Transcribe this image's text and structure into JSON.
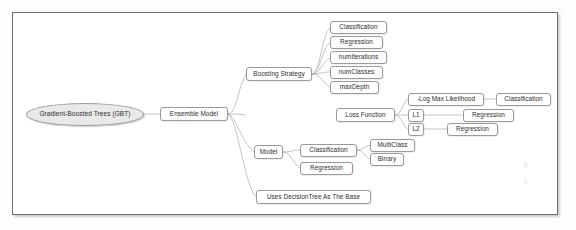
{
  "diagram": {
    "type": "mind-map",
    "root": "Gradient-Boosted Trees (GBT)",
    "nodes": {
      "root": "Gradient-Boosted Trees (GBT)",
      "ensemble_model": "Ensemble Model",
      "boosting_strategy": "Boosting Strategy",
      "bs_classification": "Classification",
      "bs_regression": "Regression",
      "bs_numiterations": "numIterations",
      "bs_numclasses": "numClasses",
      "bs_maxdepth": "maxDepth",
      "loss_function": "Loss Function",
      "lf_logmax": "-Log Max Likelihood",
      "lf_logmax_target": "Classification",
      "lf_l1": "L1",
      "lf_l1_target": "Regression",
      "lf_l2": "L2",
      "lf_l2_target": "Regression",
      "model": "Model",
      "model_classification": "Classification",
      "model_multiclass": "MultiClass",
      "model_binary": "Binary",
      "model_regression": "Regression",
      "uses_decisiontree": "Uses DecisionTree As The Base"
    },
    "edges": [
      {
        "from": "root",
        "to": "ensemble_model"
      },
      {
        "from": "ensemble_model",
        "to": "boosting_strategy"
      },
      {
        "from": "ensemble_model",
        "to": "loss_function"
      },
      {
        "from": "ensemble_model",
        "to": "model"
      },
      {
        "from": "ensemble_model",
        "to": "uses_decisiontree"
      },
      {
        "from": "boosting_strategy",
        "to": "bs_classification"
      },
      {
        "from": "boosting_strategy",
        "to": "bs_regression"
      },
      {
        "from": "boosting_strategy",
        "to": "bs_numiterations"
      },
      {
        "from": "boosting_strategy",
        "to": "bs_numclasses"
      },
      {
        "from": "boosting_strategy",
        "to": "bs_maxdepth"
      },
      {
        "from": "loss_function",
        "to": "lf_logmax"
      },
      {
        "from": "loss_function",
        "to": "lf_l1"
      },
      {
        "from": "loss_function",
        "to": "lf_l2"
      },
      {
        "from": "lf_logmax",
        "to": "lf_logmax_target"
      },
      {
        "from": "lf_l1",
        "to": "lf_l1_target"
      },
      {
        "from": "lf_l2",
        "to": "lf_l2_target"
      },
      {
        "from": "model",
        "to": "model_classification"
      },
      {
        "from": "model",
        "to": "model_regression"
      },
      {
        "from": "model_classification",
        "to": "model_multiclass"
      },
      {
        "from": "model_classification",
        "to": "model_binary"
      }
    ],
    "colors": {
      "root_fill": "#e9e9e9",
      "node_fill": "#ffffff",
      "node_border": "#9a9a9a",
      "edge": "#b4b4b4",
      "frame_border": "#6d6d6d",
      "text": "#2e2e2e"
    }
  }
}
